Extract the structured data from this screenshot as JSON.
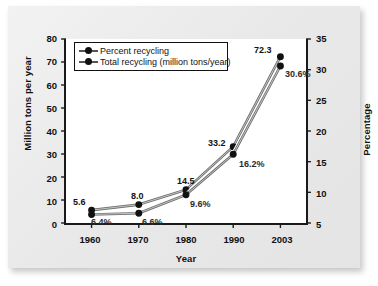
{
  "chart_data": {
    "type": "line",
    "title": "",
    "xlabel": "Year",
    "ylabel": "Million tons per year",
    "y2label": "Percentage",
    "categories": [
      "1960",
      "1970",
      "1980",
      "1990",
      "2003"
    ],
    "ylim": [
      0,
      80
    ],
    "y_ticks": [
      "0",
      "10",
      "20",
      "30",
      "40",
      "50",
      "60",
      "70",
      "80"
    ],
    "y2lim": [
      5,
      35
    ],
    "y2_ticks": [
      "5",
      "10",
      "15",
      "20",
      "25",
      "30",
      "35"
    ],
    "grid": false,
    "legend_position": "top-left",
    "series": [
      {
        "name": "Total recycling (million tons/year)",
        "axis": "left",
        "values": [
          5.6,
          8.0,
          14.5,
          33.2,
          72.3
        ],
        "labels": [
          "5.6",
          "8.0",
          "14.5",
          "33.2",
          "72.3"
        ],
        "marker": "filled-circle",
        "color": "#111111",
        "line_color": "#6e6e6e"
      },
      {
        "name": "Percent recycling",
        "axis": "right",
        "values": [
          6.4,
          6.6,
          9.6,
          16.2,
          30.6
        ],
        "labels": [
          "6.4%",
          "6.6%",
          "9.6%",
          "16.2%",
          "30.6%"
        ],
        "marker": "filled-circle",
        "color": "#111111",
        "line_color": "#6e6e6e"
      }
    ]
  },
  "legend": {
    "items": [
      {
        "label": "Percent recycling"
      },
      {
        "label": "Total recycling (million tons/year)"
      }
    ]
  },
  "colors": {
    "page_background": "#ececec",
    "plot_background": "#ffffff",
    "axis": "#1a1a1a",
    "marker": "#111111",
    "line": "#6e6e6e",
    "text": "#111111"
  }
}
